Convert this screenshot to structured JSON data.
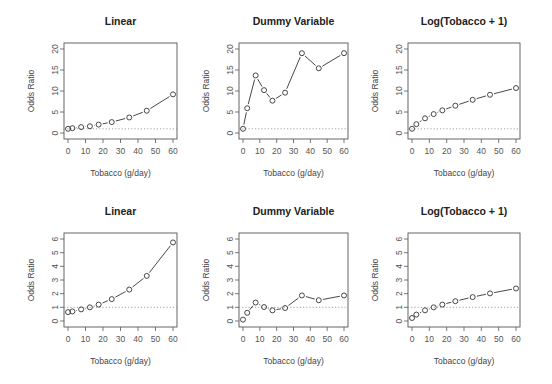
{
  "figure": {
    "xlabel": "Tobacco (g/day)",
    "ylabel": "Odds Ratio",
    "reference_line": 1
  },
  "chart_data": [
    {
      "type": "line",
      "title": "Linear",
      "xlabel": "Tobacco (g/day)",
      "ylabel": "Odds Ratio",
      "x": [
        0,
        2.5,
        7.5,
        12.5,
        17.5,
        25,
        35,
        45,
        60
      ],
      "values": [
        1.0,
        1.15,
        1.4,
        1.6,
        2.0,
        2.6,
        3.7,
        5.3,
        9.2
      ],
      "xlim": [
        0,
        60
      ],
      "ylim": [
        0,
        20
      ],
      "xticks": [
        0,
        10,
        20,
        30,
        40,
        50,
        60
      ],
      "yticks": [
        0,
        5,
        10,
        15,
        20
      ],
      "grid": false,
      "reference_line": 1
    },
    {
      "type": "line",
      "title": "Dummy Variable",
      "xlabel": "Tobacco (g/day)",
      "ylabel": "Odds Ratio",
      "x": [
        0,
        2.5,
        7.5,
        12.5,
        17.5,
        25,
        35,
        45,
        60
      ],
      "values": [
        1.0,
        5.9,
        13.7,
        10.2,
        7.7,
        9.6,
        19.0,
        15.4,
        19.0
      ],
      "xlim": [
        0,
        60
      ],
      "ylim": [
        0,
        20
      ],
      "xticks": [
        0,
        10,
        20,
        30,
        40,
        50,
        60
      ],
      "yticks": [
        0,
        5,
        10,
        15,
        20
      ],
      "grid": false,
      "reference_line": 1
    },
    {
      "type": "line",
      "title": "Log(Tobacco + 1)",
      "xlabel": "Tobacco (g/day)",
      "ylabel": "Odds Ratio",
      "x": [
        0,
        2.5,
        7.5,
        12.5,
        17.5,
        25,
        35,
        45,
        60
      ],
      "values": [
        1.0,
        2.1,
        3.5,
        4.5,
        5.4,
        6.5,
        7.9,
        9.1,
        10.7
      ],
      "xlim": [
        0,
        60
      ],
      "ylim": [
        0,
        20
      ],
      "xticks": [
        0,
        10,
        20,
        30,
        40,
        50,
        60
      ],
      "yticks": [
        0,
        5,
        10,
        15,
        20
      ],
      "grid": false,
      "reference_line": 1
    },
    {
      "type": "line",
      "title": "Linear",
      "xlabel": "Tobacco (g/day)",
      "ylabel": "Odds Ratio",
      "x": [
        0,
        2.5,
        7.5,
        12.5,
        17.5,
        25,
        35,
        45,
        60
      ],
      "values": [
        0.65,
        0.7,
        0.85,
        1.0,
        1.2,
        1.6,
        2.3,
        3.3,
        5.75
      ],
      "xlim": [
        0,
        60
      ],
      "ylim": [
        0,
        6
      ],
      "xticks": [
        0,
        10,
        20,
        30,
        40,
        50,
        60
      ],
      "yticks": [
        0,
        1,
        2,
        3,
        4,
        5,
        6
      ],
      "grid": false,
      "reference_line": 1
    },
    {
      "type": "line",
      "title": "Dummy Variable",
      "xlabel": "Tobacco (g/day)",
      "ylabel": "Odds Ratio",
      "x": [
        0,
        2.5,
        7.5,
        12.5,
        17.5,
        25,
        35,
        45,
        60
      ],
      "values": [
        0.1,
        0.6,
        1.35,
        1.02,
        0.78,
        0.95,
        1.87,
        1.52,
        1.87
      ],
      "xlim": [
        0,
        60
      ],
      "ylim": [
        0,
        6
      ],
      "xticks": [
        0,
        10,
        20,
        30,
        40,
        50,
        60
      ],
      "yticks": [
        0,
        1,
        2,
        3,
        4,
        5,
        6
      ],
      "grid": false,
      "reference_line": 1
    },
    {
      "type": "line",
      "title": "Log(Tobacco + 1)",
      "xlabel": "Tobacco (g/day)",
      "ylabel": "Odds Ratio",
      "x": [
        0,
        2.5,
        7.5,
        12.5,
        17.5,
        25,
        35,
        45,
        60
      ],
      "values": [
        0.22,
        0.47,
        0.78,
        1.0,
        1.2,
        1.45,
        1.75,
        2.02,
        2.38
      ],
      "xlim": [
        0,
        60
      ],
      "ylim": [
        0,
        6
      ],
      "xticks": [
        0,
        10,
        20,
        30,
        40,
        50,
        60
      ],
      "yticks": [
        0,
        1,
        2,
        3,
        4,
        5,
        6
      ],
      "grid": false,
      "reference_line": 1
    }
  ]
}
